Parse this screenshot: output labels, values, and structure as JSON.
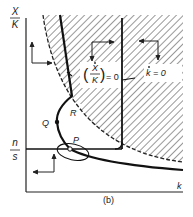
{
  "diagram": {
    "panel_label": "(b)",
    "y_axis": {
      "label_num": "X",
      "label_den": "K"
    },
    "x_axis": {
      "label": "k"
    },
    "level_label": {
      "num": "n",
      "den": "s"
    },
    "curves": {
      "xk_dot_zero": {
        "label_num": "X",
        "label_den": "K",
        "label_suffix": "= 0"
      },
      "k_dot_zero": {
        "label": "k = 0"
      }
    },
    "points": [
      {
        "name": "R",
        "label": "R"
      },
      {
        "name": "Q",
        "label": "Q"
      },
      {
        "name": "P",
        "label": "P"
      }
    ],
    "colors": {
      "line": "#1a1a1a",
      "hatch": "#333333",
      "background": "#ffffff"
    }
  }
}
